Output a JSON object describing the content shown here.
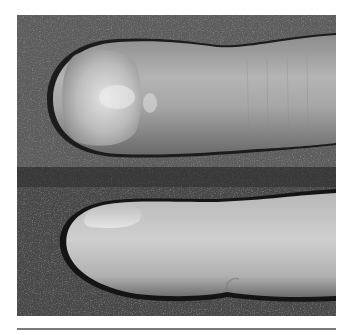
{
  "figure": {
    "alt": "Two grayscale photographs of a fingertip: top panel viewed from above showing the nail, bottom panel viewed from the side",
    "panels": [
      {
        "id": "top",
        "view": "dorsal view of fingertip with nail"
      },
      {
        "id": "bottom",
        "view": "lateral view of fingertip"
      }
    ],
    "colors": {
      "background_top": "#5e5e5e",
      "background_bottom": "#4a4a4a",
      "skin_light": "#d6d6d6",
      "skin_mid": "#a8a8a8",
      "shadow": "#1a1a1a",
      "rule": "#7a7a7a"
    }
  }
}
